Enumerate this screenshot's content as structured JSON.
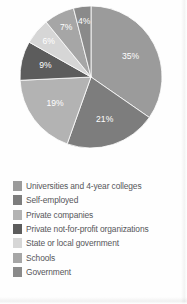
{
  "chart_data": {
    "type": "pie",
    "title": "",
    "subtitle": "",
    "xlabel": "",
    "ylabel": "",
    "legend_position": "bottom",
    "grid": false,
    "categories": [
      "Universities and 4-year colleges",
      "Self-employed",
      "Private companies",
      "Private not-for-profit organizations",
      "State or local government",
      "Schools",
      "Government"
    ],
    "values": [
      35,
      21,
      19,
      9,
      6,
      7,
      4
    ],
    "labels": [
      "35%",
      "21%",
      "19%",
      "9%",
      "6%",
      "7%",
      "4%"
    ],
    "colors": [
      "#9b9b9b",
      "#7d7d7d",
      "#b3b3b3",
      "#5c5c5c",
      "#d6d6d6",
      "#a6a6a6",
      "#8a8a8a"
    ],
    "slices": [
      {
        "category": "Universities and 4-year colleges",
        "value": 35,
        "label": "35%",
        "color": "#9b9b9b"
      },
      {
        "category": "Self-employed",
        "value": 21,
        "label": "21%",
        "color": "#7d7d7d"
      },
      {
        "category": "Private companies",
        "value": 19,
        "label": "19%",
        "color": "#b3b3b3"
      },
      {
        "category": "Private not-for-profit organizations",
        "value": 9,
        "label": "9%",
        "color": "#5c5c5c"
      },
      {
        "category": "State or local government",
        "value": 6,
        "label": "6%",
        "color": "#d6d6d6"
      },
      {
        "category": "Schools",
        "value": 7,
        "label": "7%",
        "color": "#a6a6a6"
      },
      {
        "category": "Government",
        "value": 4,
        "label": "4%",
        "color": "#8a8a8a"
      }
    ]
  },
  "legend": {
    "items": [
      {
        "label": "Universities and 4-year colleges",
        "color": "#9b9b9b"
      },
      {
        "label": "Self-employed",
        "color": "#7d7d7d"
      },
      {
        "label": "Private companies",
        "color": "#b3b3b3"
      },
      {
        "label": "Private not-for-profit organizations",
        "color": "#5c5c5c"
      },
      {
        "label": "State or local government",
        "color": "#d6d6d6"
      },
      {
        "label": "Schools",
        "color": "#a6a6a6"
      },
      {
        "label": "Government",
        "color": "#8a8a8a"
      }
    ]
  }
}
